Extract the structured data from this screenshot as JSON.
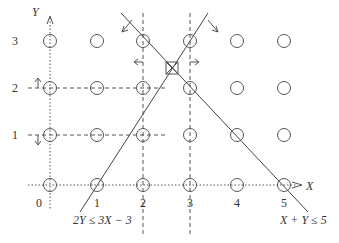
{
  "diagram": {
    "axes": {
      "x_label": "X",
      "y_label": "Y",
      "x_ticks": [
        "1",
        "2",
        "3",
        "4",
        "5"
      ],
      "y_ticks": [
        "0",
        "1",
        "2",
        "3"
      ]
    },
    "constraints": [
      {
        "id": "c1",
        "label": "2Y ≤ 3X − 3"
      },
      {
        "id": "c2",
        "label": "X + Y ≤ 5"
      }
    ],
    "lattice": {
      "x_values": [
        0,
        1,
        2,
        3,
        4,
        5
      ],
      "y_values": [
        0,
        1,
        2,
        3
      ]
    },
    "colors": {
      "stroke": "#444444",
      "text": "#333333",
      "background": "#ffffff"
    }
  }
}
